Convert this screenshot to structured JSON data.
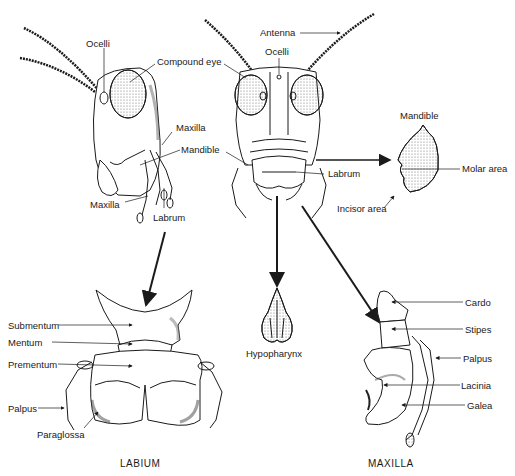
{
  "figure": {
    "lateral_head_labels": {
      "ocelli": "Ocelli",
      "compound_eye": "Compound eye",
      "maxilla_upper": "Maxilla",
      "mandible": "Mandible",
      "maxilla_lower": "Maxilla",
      "labrum": "Labrum"
    },
    "frontal_head_labels": {
      "antenna": "Antenna",
      "ocelli": "Ocelli",
      "labrum": "Labrum"
    },
    "mandible_detail": {
      "title": "Mandible",
      "molar_area": "Molar area",
      "incisor_area": "Incisor area"
    },
    "labium": {
      "caption": "LABIUM",
      "submentum": "Submentum",
      "mentum": "Mentum",
      "prementum": "Prementum",
      "palpus": "Palpus",
      "paraglossa": "Paraglossa"
    },
    "hypopharynx": {
      "caption": "Hypopharynx"
    },
    "maxilla": {
      "caption": "MAXILLA",
      "cardo": "Cardo",
      "stipes": "Stipes",
      "palpus": "Palpus",
      "lacinia": "Lacinia",
      "galea": "Galea"
    }
  },
  "colors": {
    "ink": "#1a1a1a",
    "background": "#ffffff",
    "shade": "#9a9a9a"
  }
}
